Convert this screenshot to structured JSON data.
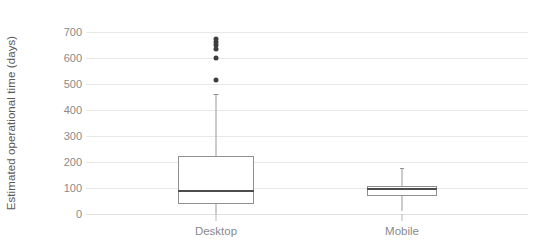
{
  "chart_data": {
    "type": "box",
    "title": "",
    "xlabel": "",
    "ylabel": "Estimated operational time (days)",
    "ylim": [
      0,
      730
    ],
    "yticks": [
      0,
      100,
      200,
      300,
      400,
      500,
      600,
      700
    ],
    "ytick_labels": [
      "0",
      "100",
      "200",
      "300",
      "400",
      "500",
      "600",
      "700"
    ],
    "categories": [
      "Desktop",
      "Mobile"
    ],
    "grid": "horizontal",
    "legend": "none",
    "colors": {
      "background": "#ffffff",
      "gridline": "#e8e8e8",
      "box_edge": "#8f8f8f",
      "median": "#4d4d4d",
      "whisker": "#9a9a9a",
      "outlier": "#3d3d3d",
      "text": "#8a8a8a",
      "axis_title": "#595959"
    },
    "boxes": [
      {
        "name": "Desktop",
        "whisker_low": 0,
        "q1": 38,
        "median": 88,
        "q3": 222,
        "whisker_high": 460,
        "outliers": [
          515,
          600,
          635,
          650,
          662,
          672
        ]
      },
      {
        "name": "Mobile",
        "whisker_low": 10,
        "q1": 69,
        "median": 96,
        "q3": 108,
        "whisker_high": 177,
        "outliers": []
      }
    ]
  }
}
